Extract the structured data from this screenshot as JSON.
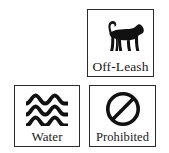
{
  "sheet": {
    "title": "Trail symbol legend",
    "background_color": "#ffffff",
    "ink_color": "#1a1a1a",
    "border_color": "#2b2b2b"
  },
  "tiles": [
    {
      "id": "off-leash",
      "caption": "Off-Leash",
      "icon": "dog-silhouette-icon",
      "icon_description": "Solid black silhouette of a standing dog facing right with an upward curving tail",
      "position": "top-right"
    },
    {
      "id": "water",
      "caption": "Water",
      "icon": "water-waves-icon",
      "icon_description": "Three stacked thick wavy lines representing water",
      "position": "bottom-left"
    },
    {
      "id": "prohibited",
      "caption": "Prohibited",
      "icon": "prohibition-circle-icon",
      "icon_description": "Circle with a thick diagonal bar from upper right to lower left",
      "position": "bottom-right"
    }
  ]
}
